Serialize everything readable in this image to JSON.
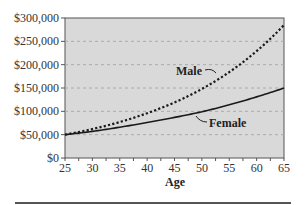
{
  "chart_data": {
    "type": "line",
    "title": "",
    "xlabel": "Age",
    "ylabel": "",
    "xlim": [
      25,
      65
    ],
    "ylim": [
      0,
      300000
    ],
    "x_ticks": [
      25,
      30,
      35,
      40,
      45,
      50,
      55,
      60,
      65
    ],
    "x_tick_labels": [
      "25",
      "30",
      "35",
      "40",
      "45",
      "50",
      "55",
      "60",
      "65"
    ],
    "y_ticks": [
      0,
      50000,
      100000,
      150000,
      200000,
      250000,
      300000
    ],
    "y_tick_labels": [
      "$0",
      "$50,000",
      "$100,000",
      "$150,000",
      "$200,000",
      "$250,000",
      "$300,000"
    ],
    "grid": true,
    "legend": "inline labels with leader lines",
    "x": [
      25,
      30,
      35,
      40,
      45,
      50,
      55,
      60,
      65
    ],
    "series": [
      {
        "name": "Male",
        "style": "dotted",
        "values": [
          50000,
          62000,
          77000,
          96000,
          119000,
          148000,
          184000,
          229000,
          285000
        ]
      },
      {
        "name": "Female",
        "style": "solid",
        "values": [
          50000,
          57000,
          66000,
          76000,
          87000,
          99000,
          114000,
          131000,
          150000
        ]
      }
    ],
    "annotations": [
      {
        "text": "Male",
        "near_age": 47,
        "near_value": 185000
      },
      {
        "text": "Female",
        "near_age": 52,
        "near_value": 75000
      }
    ],
    "colors": {
      "plot_background": "#d9d9d9",
      "gridline": "#aaaaaa",
      "line": "#1a1a1a"
    }
  }
}
